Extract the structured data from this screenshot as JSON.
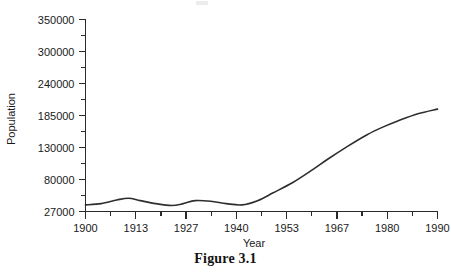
{
  "figure": {
    "caption": "Figure 3.1"
  },
  "chart_data": {
    "type": "line",
    "title": "",
    "xlabel": "Year",
    "ylabel": "Population",
    "grid": false,
    "legend": false,
    "x_tick_labels": [
      "1900",
      "1913",
      "1927",
      "1940",
      "1953",
      "1967",
      "1980",
      "1990"
    ],
    "y_tick_labels": [
      "27000",
      "80000",
      "130000",
      "185000",
      "240000",
      "300000",
      "350000"
    ],
    "y_axis_note": "Tick marks are evenly spaced but carry irregular numeric values",
    "x_minor_ticks_per_interval": 1,
    "y_minor_ticks_per_interval": 1,
    "xlim": [
      1900,
      1990
    ],
    "ylim": [
      27000,
      350000
    ],
    "series": [
      {
        "name": "Population",
        "x": [
          1900,
          1904,
          1908,
          1911,
          1914,
          1918,
          1922,
          1925,
          1928,
          1932,
          1936,
          1940,
          1944,
          1948,
          1953,
          1958,
          1962,
          1967,
          1972,
          1976,
          1980,
          1985,
          1990
        ],
        "values": [
          38000,
          40000,
          46000,
          49000,
          45000,
          40000,
          37000,
          40000,
          45000,
          44000,
          40000,
          38000,
          45000,
          58000,
          75000,
          95000,
          112000,
          132000,
          152000,
          165000,
          176000,
          188000,
          196000
        ]
      }
    ]
  }
}
